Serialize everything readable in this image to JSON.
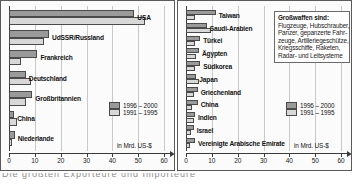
{
  "chart_data": [
    {
      "type": "bar",
      "orientation": "horizontal",
      "title": "Größte Exporteure von Großwaffen",
      "xlabel": "in Mrd. US-$",
      "ylabel": "",
      "xlim": [
        0,
        60
      ],
      "xticks": [
        0,
        10,
        20,
        30,
        40,
        50,
        60
      ],
      "grid": true,
      "legend_position": "inside-right",
      "categories": [
        "USA",
        "UdSSR/Russland",
        "Frankreich",
        "Deutschland",
        "Großbritannien",
        "China",
        "Niederlande"
      ],
      "series": [
        {
          "name": "1996 – 2000",
          "color": "#9a9a9a",
          "values": [
            48.5,
            15.5,
            11.0,
            6.5,
            9.0,
            2.0,
            2.2
          ]
        },
        {
          "name": "1991 – 1995",
          "color": "#d8d8d8",
          "values": [
            52.5,
            13.5,
            4.5,
            8.5,
            6.5,
            3.0,
            1.2
          ]
        }
      ]
    },
    {
      "type": "bar",
      "orientation": "horizontal",
      "title": "Größte Importeure von Großwaffen",
      "xlabel": "in Mrd. US-$",
      "ylabel": "",
      "xlim": [
        0,
        60
      ],
      "xticks": [
        0,
        10,
        20,
        30,
        40,
        50,
        60
      ],
      "grid": true,
      "legend_position": "inside-right",
      "categories": [
        "Taiwan",
        "Saudi-Arabien",
        "Türkei",
        "Ägypten",
        "Südkorea",
        "Japan",
        "Griechenland",
        "China",
        "Indien",
        "Israel",
        "Vereinigte Arabische Emirate"
      ],
      "series": [
        {
          "name": "1996 – 2000",
          "color": "#9a9a9a",
          "values": [
            11.5,
            8.0,
            5.5,
            5.0,
            5.5,
            4.0,
            4.5,
            4.5,
            3.5,
            3.0,
            3.5
          ]
        },
        {
          "name": "1991 – 1995",
          "color": "#d8d8d8",
          "values": [
            3.5,
            9.5,
            3.5,
            4.0,
            3.5,
            5.0,
            3.0,
            2.5,
            3.0,
            2.0,
            1.5
          ]
        }
      ]
    }
  ],
  "left_chart": {
    "axis_unit": "in Mrd. US-$",
    "tick_labels": [
      "0",
      "10",
      "20",
      "30",
      "40",
      "50",
      "60"
    ],
    "categories": [
      "USA",
      "UdSSR/Russland",
      "Frankreich",
      "Deutschland",
      "Großbritannien",
      "China",
      "Niederlande"
    ],
    "legend": [
      {
        "label": "1996 – 2000",
        "tone": "dark"
      },
      {
        "label": "1991 – 1995",
        "tone": "light"
      }
    ]
  },
  "right_chart": {
    "axis_unit": "in Mrd. US-$",
    "tick_labels": [
      "0",
      "10",
      "20",
      "30",
      "40",
      "50",
      "60"
    ],
    "categories": [
      "Taiwan",
      "Saudi-Arabien",
      "Türkei",
      "Ägypten",
      "Südkorea",
      "Japan",
      "Griechenland",
      "China",
      "Indien",
      "Israel",
      "Vereinigte Arabische Emirate"
    ],
    "legend": [
      {
        "label": "1996 – 2000",
        "tone": "dark"
      },
      {
        "label": "1991 – 1995",
        "tone": "light"
      }
    ],
    "infobox": {
      "title": "Großwaffen sind:",
      "lines": [
        "Flugzeuge, Hubschrauber,",
        "Panzer, gepanzerte Fahr-",
        "zeuge, Artilleriegeschütze,",
        "Kriegsschiffe, Raketen,",
        "Radar- und Leitsysteme"
      ]
    }
  },
  "caption": {
    "text": "Die größten Exporteure und Importeure"
  },
  "colors": {
    "bar_dark": "#9a9a9a",
    "bar_light": "#d8d8d8",
    "frame": "#5a5a5a",
    "grid": "#c9c9c9",
    "axis": "#3b3b3b"
  }
}
